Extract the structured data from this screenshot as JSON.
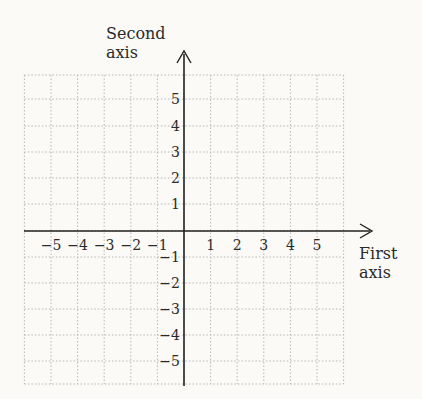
{
  "diagram": {
    "type": "cartesian-coordinate-grid",
    "x_axis": {
      "label_line1": "First",
      "label_line2": "axis",
      "ticks": [
        {
          "value": -5,
          "label": "−5"
        },
        {
          "value": -4,
          "label": "−4"
        },
        {
          "value": -3,
          "label": "−3"
        },
        {
          "value": -2,
          "label": "−2"
        },
        {
          "value": -1,
          "label": "−1"
        },
        {
          "value": 1,
          "label": "1"
        },
        {
          "value": 2,
          "label": "2"
        },
        {
          "value": 3,
          "label": "3"
        },
        {
          "value": 4,
          "label": "4"
        },
        {
          "value": 5,
          "label": "5"
        }
      ]
    },
    "y_axis": {
      "label_line1": "Second",
      "label_line2": "axis",
      "ticks": [
        {
          "value": 5,
          "label": "5"
        },
        {
          "value": 4,
          "label": "4"
        },
        {
          "value": 3,
          "label": "3"
        },
        {
          "value": 2,
          "label": "2"
        },
        {
          "value": 1,
          "label": "1"
        },
        {
          "value": -1,
          "label": "−1"
        },
        {
          "value": -2,
          "label": "−2"
        },
        {
          "value": -3,
          "label": "−3"
        },
        {
          "value": -4,
          "label": "−4"
        },
        {
          "value": -5,
          "label": "−5"
        }
      ]
    },
    "grid": {
      "x_range": [
        -6,
        6
      ],
      "y_range": [
        -6,
        6
      ],
      "style": "dotted"
    },
    "colors": {
      "axis": "#222222",
      "grid": "#b8b8b8",
      "background": "#fbfaf7"
    }
  }
}
